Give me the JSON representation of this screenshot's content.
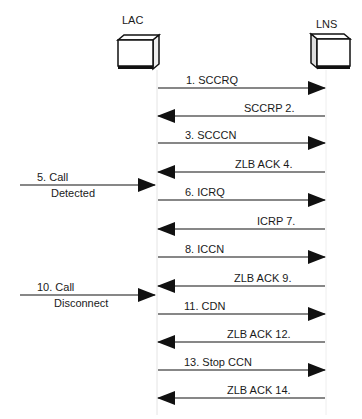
{
  "nodes": {
    "lac": {
      "label": "LAC"
    },
    "lns": {
      "label": "LNS"
    }
  },
  "messages": [
    {
      "id": 1,
      "label": "1. SCCRQ",
      "direction": "lac-to-lns"
    },
    {
      "id": 2,
      "label": "SCCRP  2.",
      "direction": "lns-to-lac"
    },
    {
      "id": 3,
      "label": "3. SCCCN",
      "direction": "lac-to-lns"
    },
    {
      "id": 4,
      "label": "ZLB ACK  4.",
      "direction": "lns-to-lac"
    },
    {
      "id": 6,
      "label": "6. ICRQ",
      "direction": "lac-to-lns"
    },
    {
      "id": 7,
      "label": "ICRP  7.",
      "direction": "lns-to-lac"
    },
    {
      "id": 8,
      "label": "8. ICCN",
      "direction": "lac-to-lns"
    },
    {
      "id": 9,
      "label": "ZLB ACK  9.",
      "direction": "lns-to-lac"
    },
    {
      "id": 11,
      "label": "11. CDN",
      "direction": "lac-to-lns"
    },
    {
      "id": 12,
      "label": "ZLB ACK  12.",
      "direction": "lns-to-lac"
    },
    {
      "id": 13,
      "label": "13. Stop CCN",
      "direction": "lac-to-lns"
    },
    {
      "id": 14,
      "label": "ZLB ACK  14.",
      "direction": "lns-to-lac"
    }
  ],
  "events": [
    {
      "id": 5,
      "line1": "5. Call",
      "line2": "Detected"
    },
    {
      "id": 10,
      "line1": "10. Call",
      "line2": "Disconnect"
    }
  ]
}
